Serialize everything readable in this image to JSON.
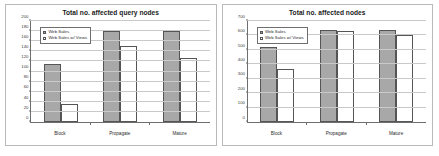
{
  "charts_common": {
    "series_names": [
      "Web Sales",
      "Web Sales w/ Views"
    ],
    "categories": [
      "Block",
      "Propagate",
      "Mature"
    ],
    "colors": {
      "series_a_fill": "#a8a8a8",
      "series_b_fill": "#ffffff",
      "bar_outline": "#555555",
      "axis": "#6e6e6e",
      "gridline": "#c9c9c9",
      "panel_border": "#b9b9b9",
      "background": "#ffffff"
    }
  },
  "chart_data": [
    {
      "type": "bar",
      "title": "Total no. affected query nodes",
      "xlabel": "",
      "ylabel": "",
      "categories": [
        "Block",
        "Propagate",
        "Mature"
      ],
      "series": [
        {
          "name": "Web Sales",
          "values": [
            115,
            180,
            180
          ]
        },
        {
          "name": "Web Sales w/ Views",
          "values": [
            35,
            150,
            126
          ]
        }
      ],
      "ylim": [
        0,
        200
      ],
      "yticks": [
        0,
        20,
        40,
        60,
        80,
        100,
        120,
        140,
        160,
        180,
        200
      ],
      "ytick_labels": [
        "0",
        "20",
        "40",
        "60",
        "80",
        "100",
        "120",
        "140",
        "160",
        "180",
        "200"
      ],
      "grid": true,
      "legend_position": "upper-left"
    },
    {
      "type": "bar",
      "title": "Total no. affected nodes",
      "xlabel": "",
      "ylabel": "",
      "categories": [
        "Block",
        "Propagate",
        "Mature"
      ],
      "series": [
        {
          "name": "Web Sales",
          "values": [
            520,
            640,
            640
          ]
        },
        {
          "name": "Web Sales w/ Views",
          "values": [
            370,
            630,
            600
          ]
        }
      ],
      "ylim": [
        0,
        700
      ],
      "yticks": [
        0,
        100,
        200,
        300,
        400,
        500,
        600,
        700
      ],
      "ytick_labels": [
        "0",
        "100",
        "200",
        "300",
        "400",
        "500",
        "600",
        "700"
      ],
      "grid": true,
      "legend_position": "upper-left"
    }
  ]
}
